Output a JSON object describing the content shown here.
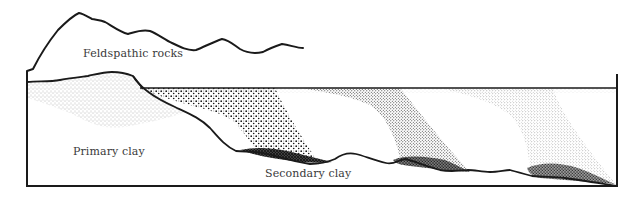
{
  "diagram": {
    "type": "geological cross-section",
    "labels": {
      "feldspathic_rocks": "Feldspathic rocks",
      "primary_clay": "Primary clay",
      "secondary_clay": "Secondary clay"
    },
    "colors": {
      "line": "#1a1a1a",
      "background": "#ffffff",
      "text": "#3a3a3a",
      "stipple_dark": "#111111",
      "stipple_light": "#777777"
    },
    "regions": [
      {
        "name": "Feldspathic rocks",
        "description": "mountain range outline at top"
      },
      {
        "name": "Primary clay",
        "description": "light stippled deposit at left, in place beside source rock"
      },
      {
        "name": "Secondary clay",
        "description": "transported sediment plumes settling along the basin floor, coarse near source, finer further away"
      }
    ]
  }
}
